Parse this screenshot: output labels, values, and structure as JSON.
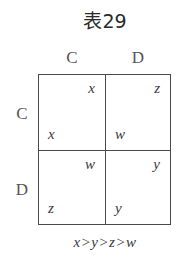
{
  "title": "表29",
  "columns": {
    "labels": [
      "C",
      "D"
    ]
  },
  "rows": {
    "labels": [
      "C",
      "D"
    ]
  },
  "matrix": {
    "cells": [
      [
        {
          "row_player": "x",
          "col_player": "x"
        },
        {
          "row_player": "w",
          "col_player": "z"
        }
      ],
      [
        {
          "row_player": "z",
          "col_player": "w"
        },
        {
          "row_player": "y",
          "col_player": "y"
        }
      ]
    ]
  },
  "caption": "x>y>z>w",
  "colors": {
    "line": "#4a4a4a",
    "text": "#3a3a3a",
    "background": "#ffffff"
  }
}
